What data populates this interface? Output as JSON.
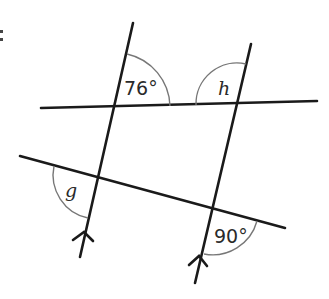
{
  "figure": {
    "type": "parallel lines cut by transversals",
    "parallel_marker": "arrow",
    "angles": {
      "a1": {
        "label": "76°",
        "kind": "given"
      },
      "a2": {
        "label": "h",
        "kind": "unknown"
      },
      "a3": {
        "label": "g",
        "kind": "unknown"
      },
      "a4": {
        "label": "90°",
        "kind": "given"
      }
    },
    "colors": {
      "line": "#1a1a1a",
      "arc": "#777777",
      "text": "#2a2a2a"
    }
  }
}
